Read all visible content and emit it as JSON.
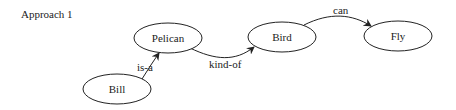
{
  "title": "Approach 1",
  "nodes": {
    "bill": {
      "label": "Bill"
    },
    "pelican": {
      "label": "Pelican"
    },
    "bird": {
      "label": "Bird"
    },
    "fly": {
      "label": "Fly"
    }
  },
  "edges": {
    "bill_pelican": {
      "label": "is-a"
    },
    "pelican_bird": {
      "label": "kind-of"
    },
    "bird_fly": {
      "label": "can"
    }
  },
  "colors": {
    "stroke": "#222222",
    "background": "#ffffff"
  }
}
